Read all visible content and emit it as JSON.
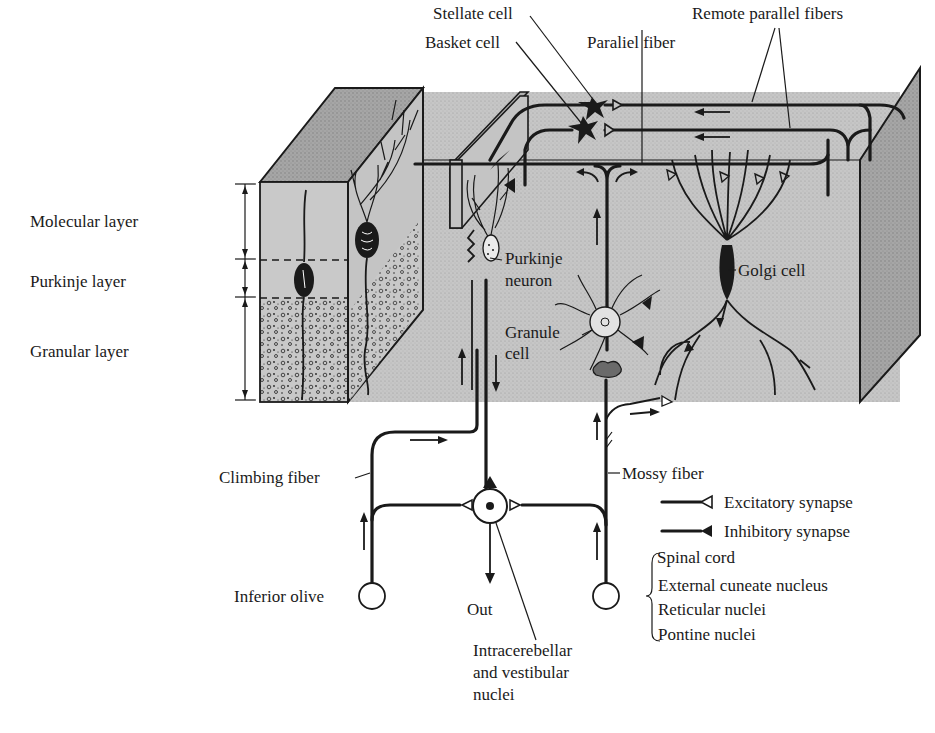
{
  "colors": {
    "block_front": "#c4c4c4",
    "block_top": "#a8a8a8",
    "block_side": "#9d9d9d",
    "ink": "#1a1a1a",
    "background": "#ffffff"
  },
  "layers": {
    "molecular": "Molecular layer",
    "purkinje": "Purkinje layer",
    "granular": "Granular layer"
  },
  "cells": {
    "stellate": "Stellate cell",
    "basket": "Basket cell",
    "parallel_fiber": "Paraliel fiber",
    "remote_parallel": "Remote parallel fibers",
    "purkinje_line1": "Purkinje",
    "purkinje_line2": "neuron",
    "granule_line1": "Granule",
    "granule_line2": "cell",
    "golgi": "Golgi cell"
  },
  "fibers": {
    "climbing": "Climbing fiber",
    "mossy": "Mossy fiber"
  },
  "nuclei": {
    "inferior_olive": "Inferior olive",
    "out": "Out",
    "intracerebellar_line1": "Intracerebellar",
    "intracerebellar_line2": "and vestibular",
    "intracerebellar_line3": "nuclei"
  },
  "legend": {
    "excitatory": "Excitatory synapse",
    "inhibitory": "Inhibitory synapse"
  },
  "mossy_sources": [
    "Spinal cord",
    "External cuneate nucleus",
    "Reticular nuclei",
    "Pontine nuclei"
  ]
}
